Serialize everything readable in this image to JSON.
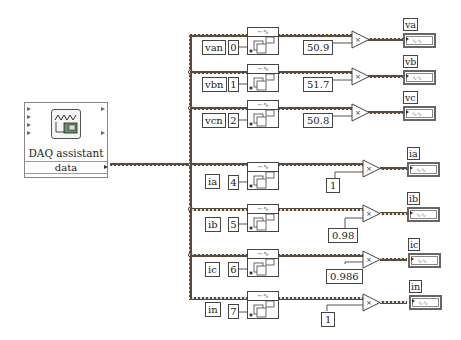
{
  "daq": {
    "title": "DAQ assistant",
    "output_label": "data"
  },
  "channels": [
    {
      "name": "van",
      "index": "0",
      "constant": "50.9",
      "indicator": "va"
    },
    {
      "name": "vbn",
      "index": "1",
      "constant": "51.7",
      "indicator": "vb"
    },
    {
      "name": "vcn",
      "index": "2",
      "constant": "50.8",
      "indicator": "vc"
    },
    {
      "name": "ia",
      "index": "4",
      "constant": "1",
      "indicator": "ia"
    },
    {
      "name": "ib",
      "index": "5",
      "constant": "0.98",
      "indicator": "ib"
    },
    {
      "name": "ic",
      "index": "6",
      "constant": "0.986",
      "indicator": "ic"
    },
    {
      "name": "in",
      "index": "7",
      "constant": "1",
      "indicator": "in"
    }
  ],
  "symbols": {
    "multiply": "×",
    "waveform": "~∿",
    "indicator_glyph": "∿∿"
  },
  "colors": {
    "wire": "#6b4a2a",
    "scalar_wire": "#ff8c00",
    "border": "#444444"
  }
}
